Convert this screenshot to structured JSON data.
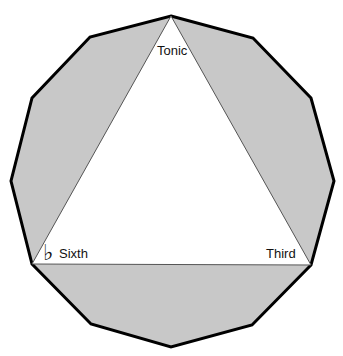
{
  "diagram": {
    "type": "chromatic-circle-augmented-triad",
    "canvas": {
      "width": 343,
      "height": 356
    },
    "colors": {
      "background": "#ffffff",
      "polygon_fill": "#c8c8c8",
      "polygon_stroke": "#000000",
      "triangle_fill": "#ffffff",
      "triangle_stroke": "#555555",
      "text": "#111111"
    },
    "dodecagon": {
      "points": "171,16 253,38 311,98 334,181 311,265 252,325 171,347 91,324 32,264 11,181 32,98 90,37"
    },
    "triangle": {
      "points": "171,16 311,265 32,264"
    },
    "labels": {
      "tonic": "Tonic",
      "third": "Third",
      "sixth": "Sixth",
      "sixth_accidental": "♭"
    }
  }
}
